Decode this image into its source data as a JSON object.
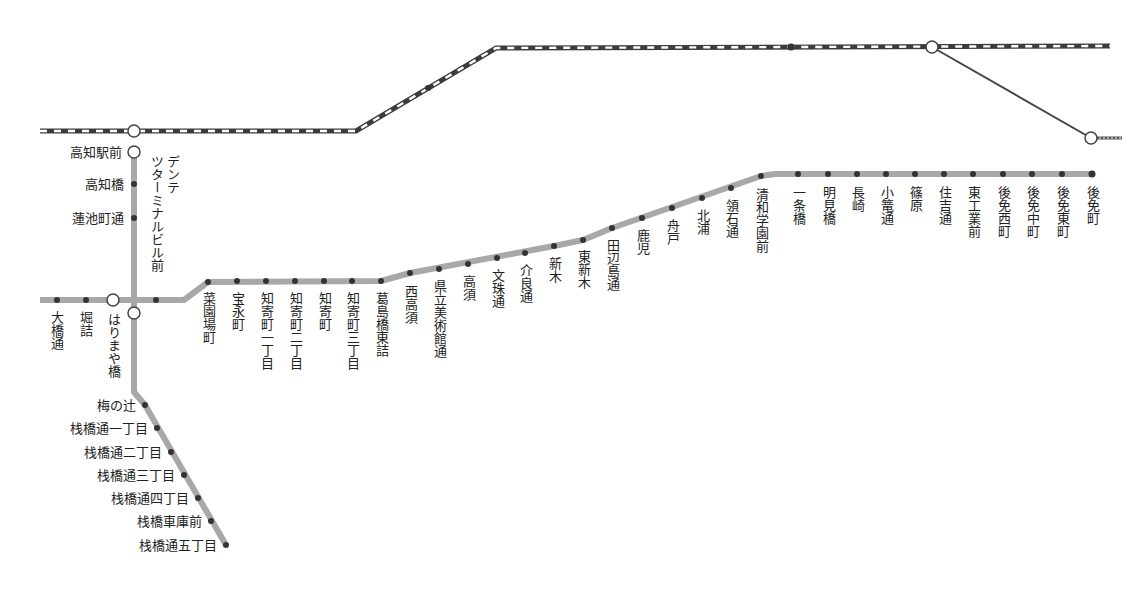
{
  "map": {
    "colors": {
      "tram_line": "#a8a8a8",
      "rail_dark": "#3c3c3c",
      "rail_light": "#ffffff",
      "stop_dot": "#333333",
      "branch_line": "#444444"
    },
    "main_line_stops": [
      {
        "name": "大橋通",
        "x": 57,
        "y": 300
      },
      {
        "name": "堀詰",
        "x": 86,
        "y": 300
      },
      {
        "name": "はりまや橋",
        "x": 113,
        "y": 300,
        "transfer": true
      },
      {
        "name": "デンテツターミナルビル前",
        "x": 156,
        "y": 300
      },
      {
        "name": "菜園場町",
        "x": 208,
        "y": 282
      },
      {
        "name": "宝永町",
        "x": 237,
        "y": 281
      },
      {
        "name": "知寄町一丁目",
        "x": 266,
        "y": 281
      },
      {
        "name": "知寄町二丁目",
        "x": 295,
        "y": 281
      },
      {
        "name": "知寄町",
        "x": 324,
        "y": 281
      },
      {
        "name": "知寄町三丁目",
        "x": 352,
        "y": 281
      },
      {
        "name": "葛島橋東詰",
        "x": 381,
        "y": 281
      },
      {
        "name": "西高須",
        "x": 410,
        "y": 273
      },
      {
        "name": "県立美術館通",
        "x": 439,
        "y": 269
      },
      {
        "name": "高須",
        "x": 468,
        "y": 264
      },
      {
        "name": "文珠通",
        "x": 497,
        "y": 258
      },
      {
        "name": "介良通",
        "x": 525,
        "y": 253
      },
      {
        "name": "新木",
        "x": 554,
        "y": 246
      },
      {
        "name": "東新木",
        "x": 583,
        "y": 240
      },
      {
        "name": "田辺島通",
        "x": 612,
        "y": 228
      },
      {
        "name": "鹿児",
        "x": 642,
        "y": 218
      },
      {
        "name": "舟戸",
        "x": 672,
        "y": 208
      },
      {
        "name": "北浦",
        "x": 702,
        "y": 198
      },
      {
        "name": "領石通",
        "x": 731,
        "y": 188
      },
      {
        "name": "清和学園前",
        "x": 761,
        "y": 176
      },
      {
        "name": "一条橋",
        "x": 798,
        "y": 174
      },
      {
        "name": "明見橋",
        "x": 828,
        "y": 174
      },
      {
        "name": "長崎",
        "x": 857,
        "y": 174
      },
      {
        "name": "小篭通",
        "x": 886,
        "y": 174
      },
      {
        "name": "篠原",
        "x": 915,
        "y": 174
      },
      {
        "name": "住吉通",
        "x": 944,
        "y": 174
      },
      {
        "name": "東工業前",
        "x": 973,
        "y": 174
      },
      {
        "name": "後免西町",
        "x": 1003,
        "y": 174
      },
      {
        "name": "後免中町",
        "x": 1032,
        "y": 174
      },
      {
        "name": "後免東町",
        "x": 1062,
        "y": 174
      },
      {
        "name": "後免町",
        "x": 1092,
        "y": 174,
        "terminal": true
      }
    ],
    "north_line_stops": [
      {
        "name": "高知駅前",
        "x": 134,
        "y": 152,
        "transfer": true
      },
      {
        "name": "高知橋",
        "x": 134,
        "y": 184
      },
      {
        "name": "蓮池町通",
        "x": 134,
        "y": 218
      }
    ],
    "south_line_stops": [
      {
        "name": "はりまや橋",
        "x": 134,
        "y": 313,
        "transfer": true
      },
      {
        "name": "梅の辻",
        "x": 145,
        "y": 405
      },
      {
        "name": "栈橋通一丁目",
        "x": 157,
        "y": 428
      },
      {
        "name": "栈橋通二丁目",
        "x": 171,
        "y": 452
      },
      {
        "name": "栈橋通三丁目",
        "x": 184,
        "y": 475
      },
      {
        "name": "栈橋通四丁目",
        "x": 198,
        "y": 498
      },
      {
        "name": "栈橋車庫前",
        "x": 211,
        "y": 521
      },
      {
        "name": "栈橋通五丁目",
        "x": 226,
        "y": 545
      }
    ],
    "labels": {
      "ohashidori": "大橋通",
      "horizume": "堀詰",
      "harimayabashi_main": "はりまや橋",
      "dentetsu": "デンテツターミナルビル前",
      "dentetsu_col1": "デンテ",
      "dentetsu_col2": "ツターミナルビル前",
      "saenbacho": "菜園場町",
      "hoeicho": "宝永町",
      "chiyoricho1": "知寄町一丁目",
      "chiyoricho2": "知寄町二丁目",
      "chiyoricho": "知寄町",
      "chiyoricho3": "知寄町三丁目",
      "kazurashima": "葛島橋東詰",
      "nishitakasu": "西高須",
      "kenritsu": "県立美術館通",
      "takasu": "高須",
      "monjudori": "文珠通",
      "keradori": "介良通",
      "shingi": "新木",
      "higashishingi": "東新木",
      "tanabeshima": "田辺島通",
      "kago": "鹿児",
      "funato": "舟戸",
      "kitaura": "北浦",
      "ryosekidori": "領石通",
      "seiwagakuen": "清和学園前",
      "ichijobashi": "一条橋",
      "myokenbashi": "明見橋",
      "nagasaki": "長崎",
      "kozekudori": "小篭通",
      "shinohara": "篠原",
      "sumiyoshidori": "住吉通",
      "higashikogyo": "東工業前",
      "gomennishi": "後免西町",
      "gomennaka": "後免中町",
      "gomenhigashi": "後免東町",
      "gomenmachi": "後免町",
      "kochiekimae": "高知駅前",
      "kochibashi": "高知橋",
      "hasuike": "蓮池町通",
      "harimayabashi_south": "はりまや橋",
      "umenotsuji": "梅の辻",
      "sanbashi1": "栈橋通一丁目",
      "sanbashi2": "栈橋通二丁目",
      "sanbashi3": "栈橋通三丁目",
      "sanbashi4": "栈橋通四丁目",
      "sanbashishako": "栈橋車庫前",
      "sanbashi5": "栈橋通五丁目"
    }
  }
}
